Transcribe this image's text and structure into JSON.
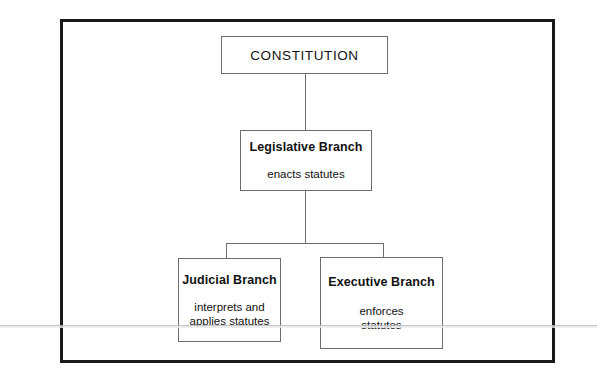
{
  "diagram": {
    "type": "hierarchy-flowchart",
    "nodes": {
      "constitution": {
        "title": "CONSTITUTION",
        "description": ""
      },
      "legislative": {
        "title": "Legislative Branch",
        "description": "enacts statutes"
      },
      "judicial": {
        "title": "Judicial Branch",
        "description": "interprets and\napplies statutes"
      },
      "executive": {
        "title": "Executive Branch",
        "description": "enforces\nstatutes"
      }
    },
    "colors": {
      "frame": "#1a1a1a",
      "box_border": "#6d6d72",
      "connector": "#6d6d72",
      "text": "#111111",
      "background": "#ffffff",
      "scan_artifact": "#b9b9bd"
    }
  }
}
